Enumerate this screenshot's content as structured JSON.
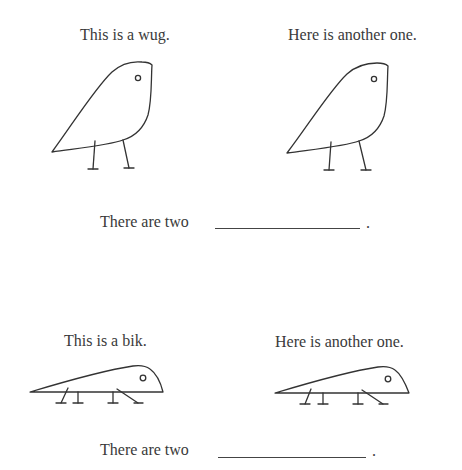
{
  "panel_top": {
    "left_caption": "This is a wug.",
    "right_caption": "Here is another one.",
    "creature": "wug",
    "prompt": {
      "prefix": "There are two",
      "blank_value": "",
      "suffix": "."
    }
  },
  "panel_bottom": {
    "left_caption": "This is a bik.",
    "right_caption": "Here is another one.",
    "creature": "bik",
    "prompt": {
      "prefix": "There are two",
      "blank_value": "",
      "suffix": "."
    }
  },
  "colors": {
    "text": "#3a3a3a",
    "line": "#333333",
    "background": "#ffffff"
  }
}
